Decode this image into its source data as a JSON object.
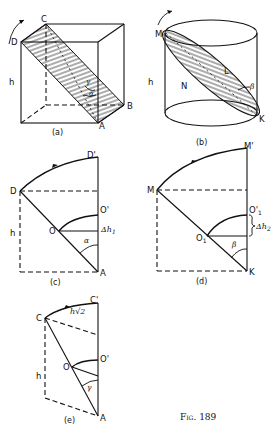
{
  "figure": {
    "caption": "Fig. 189",
    "panels": {
      "a": {
        "caption": "(a)",
        "labels": {
          "C": "C",
          "D": "D",
          "B": "B",
          "A": "A",
          "h": "h",
          "gamma": "γ",
          "alpha": "α"
        }
      },
      "b": {
        "caption": "(b)",
        "labels": {
          "M": "M",
          "N": "N",
          "L": "L",
          "K": "K",
          "h": "h",
          "beta": "β"
        }
      },
      "c": {
        "caption": "(c)",
        "labels": {
          "D": "D",
          "D_prime": "D'",
          "O": "O",
          "O_prime": "O'",
          "A": "A",
          "h": "h",
          "delta_h1": "Δh",
          "delta_h1_sub": "1",
          "alpha": "α"
        }
      },
      "d": {
        "caption": "(d)",
        "labels": {
          "M": "M",
          "M_prime": "M'",
          "O1": "O",
          "O1_sub": "1",
          "O1_prime": "O'",
          "O1_prime_sub": "1",
          "K": "K",
          "delta_h2": "Δh",
          "delta_h2_sub": "2",
          "beta": "β"
        }
      },
      "e": {
        "caption": "(e)",
        "labels": {
          "C": "C",
          "C_prime": "C'",
          "O": "O",
          "O_prime": "O'",
          "A": "A",
          "h": "h",
          "h_sqrt2": "h√2",
          "gamma": "γ"
        }
      }
    }
  }
}
